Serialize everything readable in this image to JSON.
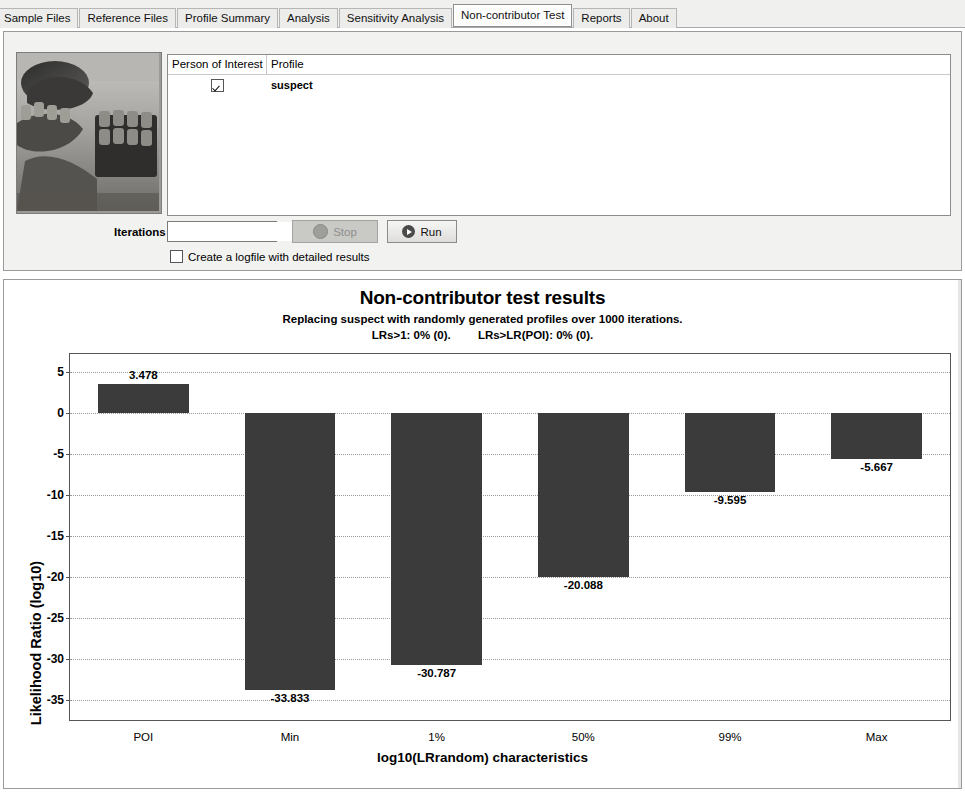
{
  "tabs": [
    {
      "label": "Sample Files",
      "selected": false
    },
    {
      "label": "Reference Files",
      "selected": false
    },
    {
      "label": "Profile Summary",
      "selected": false
    },
    {
      "label": "Analysis",
      "selected": false
    },
    {
      "label": "Sensitivity Analysis",
      "selected": false
    },
    {
      "label": "Non-contributor Test",
      "selected": true
    },
    {
      "label": "Reports",
      "selected": false
    },
    {
      "label": "About",
      "selected": false
    }
  ],
  "top_panel": {
    "thumbnail_alt": "laboratory-photo",
    "table": {
      "columns": [
        "Person of Interest",
        "Profile"
      ],
      "rows": [
        {
          "person_of_interest_checked": true,
          "profile": "suspect"
        }
      ]
    },
    "iterations_label": "Iterations",
    "iterations_value": "1,000",
    "iterations_placeholder": "1,000",
    "stop_button": "Stop",
    "run_button": "Run",
    "logfile_checkbox_label": "Create a logfile with detailed results",
    "logfile_checked": false
  },
  "chart_data": {
    "type": "bar",
    "title": "Non-contributor test results",
    "subtitle": "Replacing suspect with randomly generated profiles over 1000 iterations.",
    "stat_lrs_gt1": "LRs>1: 0% (0).",
    "stat_lrs_gt_poi": "LRs>LR(POI): 0% (0).",
    "categories": [
      "POI",
      "Min",
      "1%",
      "50%",
      "99%",
      "Max"
    ],
    "values": [
      3.478,
      -33.833,
      -30.787,
      -20.088,
      -9.595,
      -5.667
    ],
    "value_labels": [
      "3.478",
      "-33.833",
      "-30.787",
      "-20.088",
      "-9.595",
      "-5.667"
    ],
    "xlabel": "log10(LRrandom) characteristics",
    "ylabel": "Likelihood Ratio (log10)",
    "yticks": [
      5,
      0,
      -5,
      -10,
      -15,
      -20,
      -25,
      -30,
      -35
    ],
    "ytick_labels": [
      "5",
      "0",
      "-5",
      "-10",
      "-15",
      "-20",
      "-25",
      "-30",
      "-35"
    ],
    "ylim": [
      -37.5,
      7.2
    ],
    "grid": true,
    "legend": "none",
    "bar_color": "#3b3b3b"
  }
}
